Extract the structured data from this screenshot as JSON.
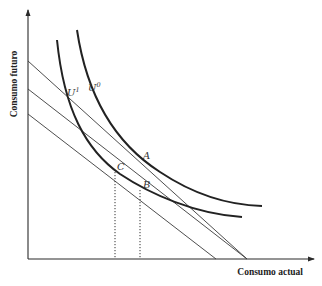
{
  "diagram": {
    "type": "economics-indifference-curves",
    "axes": {
      "x_label": "Consumo actual",
      "y_label": "Consumo futuro"
    },
    "curves": [
      {
        "id": "U0",
        "label_base": "U",
        "label_sup": "0"
      },
      {
        "id": "U1",
        "label_base": "U",
        "label_sup": "1"
      }
    ],
    "budget_lines": 3,
    "points": [
      {
        "id": "A",
        "label": "A"
      },
      {
        "id": "B",
        "label": "B"
      },
      {
        "id": "C",
        "label": "C"
      }
    ],
    "projections": [
      "C",
      "B"
    ],
    "colors": {
      "line": "#222222",
      "background": "#ffffff"
    }
  }
}
